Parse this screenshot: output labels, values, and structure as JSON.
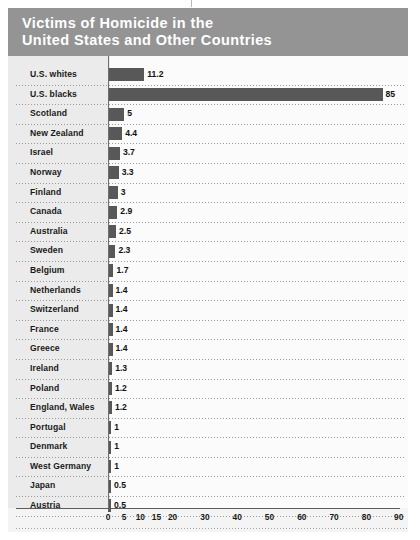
{
  "title": "Victims of Homicide in the\nUnited States and Other Countries",
  "colors": {
    "title_band": "#949494",
    "title_text": "#ffffff",
    "bar": "#585858",
    "label_column": "#ebebeb",
    "plot_area": "#fbfbfb",
    "axis": "#5c5c5c"
  },
  "chart_data": {
    "type": "bar",
    "orientation": "horizontal",
    "title": "Victims of Homicide in the United States and Other Countries",
    "xlabel": "",
    "ylabel": "",
    "xlim": [
      0,
      93
    ],
    "grid": false,
    "legend": null,
    "axis_ticks": [
      0,
      5,
      10,
      15,
      20,
      30,
      40,
      50,
      60,
      70,
      80,
      90
    ],
    "categories": [
      "U.S. whites",
      "U.S. blacks",
      "Scotland",
      "New Zealand",
      "Israel",
      "Norway",
      "Finland",
      "Canada",
      "Australia",
      "Sweden",
      "Belgium",
      "Netherlands",
      "Switzerland",
      "France",
      "Greece",
      "Ireland",
      "Poland",
      "England, Wales",
      "Portugal",
      "Denmark",
      "West Germany",
      "Japan",
      "Austria"
    ],
    "values": [
      11.2,
      85,
      5,
      4.4,
      3.7,
      3.3,
      3,
      2.9,
      2.5,
      2.3,
      1.7,
      1.4,
      1.4,
      1.4,
      1.4,
      1.3,
      1.2,
      1.2,
      1,
      1,
      1,
      0.5,
      0.5
    ],
    "value_labels": [
      "11.2",
      "85",
      "5",
      "4.4",
      "3.7",
      "3.3",
      "3",
      "2.9",
      "2.5",
      "2.3",
      "1.7",
      "1.4",
      "1.4",
      "1.4",
      "1.4",
      "1.3",
      "1.2",
      "1.2",
      "1",
      "1",
      "1",
      "0.5",
      "0.5"
    ]
  }
}
